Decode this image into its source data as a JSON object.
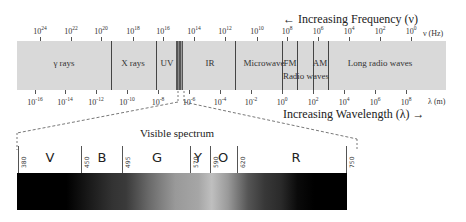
{
  "diagram": {
    "frequency_axis": {
      "title": "← Increasing Frequency (ν)",
      "unit": "ν (Hz)",
      "ticks": [
        {
          "base": "10",
          "exp": "24",
          "x": 40
        },
        {
          "base": "10",
          "exp": "22",
          "x": 71
        },
        {
          "base": "10",
          "exp": "20",
          "x": 101
        },
        {
          "base": "10",
          "exp": "18",
          "x": 133
        },
        {
          "base": "10",
          "exp": "16",
          "x": 163
        },
        {
          "base": "10",
          "exp": "14",
          "x": 194
        },
        {
          "base": "10",
          "exp": "12",
          "x": 225
        },
        {
          "base": "10",
          "exp": "10",
          "x": 257
        },
        {
          "base": "10",
          "exp": "8",
          "x": 287
        },
        {
          "base": "10",
          "exp": "6",
          "x": 318
        },
        {
          "base": "10",
          "exp": "4",
          "x": 349
        },
        {
          "base": "10",
          "exp": "2",
          "x": 380
        },
        {
          "base": "10",
          "exp": "0",
          "x": 411
        }
      ]
    },
    "wavelength_axis": {
      "title": "Increasing Wavelength (λ) →",
      "unit": "λ (m)",
      "ticks": [
        {
          "base": "10",
          "exp": "-16",
          "x": 35
        },
        {
          "base": "10",
          "exp": "-14",
          "x": 65
        },
        {
          "base": "10",
          "exp": "-12",
          "x": 96
        },
        {
          "base": "10",
          "exp": "-10",
          "x": 127
        },
        {
          "base": "10",
          "exp": "-8",
          "x": 158
        },
        {
          "base": "10",
          "exp": "-6",
          "x": 189
        },
        {
          "base": "10",
          "exp": "-4",
          "x": 220
        },
        {
          "base": "10",
          "exp": "-2",
          "x": 251
        },
        {
          "base": "10",
          "exp": "0",
          "x": 282
        },
        {
          "base": "10",
          "exp": "2",
          "x": 313
        },
        {
          "base": "10",
          "exp": "4",
          "x": 344
        },
        {
          "base": "10",
          "exp": "6",
          "x": 375
        },
        {
          "base": "10",
          "exp": "8",
          "x": 406
        }
      ]
    },
    "regions": [
      {
        "label": "γ rays",
        "x": 64,
        "y": 58
      },
      {
        "label": "X rays",
        "x": 133,
        "y": 58
      },
      {
        "label": "UV",
        "x": 167,
        "y": 58
      },
      {
        "label": "IR",
        "x": 210,
        "y": 58
      },
      {
        "label": "Microwave",
        "x": 264,
        "y": 58
      },
      {
        "label": "FM",
        "x": 290,
        "y": 58
      },
      {
        "label": "AM",
        "x": 320,
        "y": 58
      },
      {
        "label": "Radio waves",
        "x": 306,
        "y": 71
      },
      {
        "label": "Long radio waves",
        "x": 380,
        "y": 58
      }
    ],
    "region_dividers_x": [
      111,
      156,
      235,
      282,
      297,
      313,
      328
    ],
    "visible_spectrum": {
      "title": "Visible spectrum",
      "wavelength_labels_nm": [
        {
          "value": "380",
          "x": 18
        },
        {
          "value": "450",
          "x": 81
        },
        {
          "value": "495",
          "x": 122
        },
        {
          "value": "570",
          "x": 190
        },
        {
          "value": "590",
          "x": 210
        },
        {
          "value": "620",
          "x": 237
        },
        {
          "value": "750",
          "x": 346
        }
      ],
      "color_bands": [
        {
          "label": "V",
          "x": 50
        },
        {
          "label": "B",
          "x": 102
        },
        {
          "label": "G",
          "x": 157
        },
        {
          "label": "Y",
          "x": 198
        },
        {
          "label": "O",
          "x": 223
        },
        {
          "label": "R",
          "x": 296
        }
      ]
    }
  }
}
